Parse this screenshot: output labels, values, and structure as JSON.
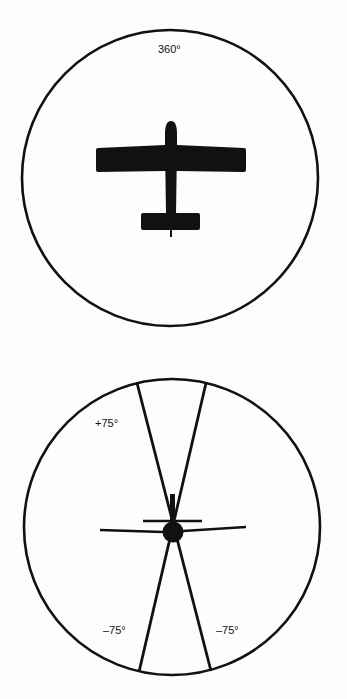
{
  "figure": {
    "top_view": {
      "label": "360°",
      "description": "Airplane top view centered in circle indicating 360° field of view"
    },
    "front_view": {
      "labels": {
        "upper_left": "+75°",
        "lower_left": "–75°",
        "lower_right": "–75°"
      },
      "description": "Airplane front view in circle with ±75° vertical viewing sectors"
    }
  },
  "colors": {
    "ink": "#111111",
    "background": "#fdfdfd"
  }
}
